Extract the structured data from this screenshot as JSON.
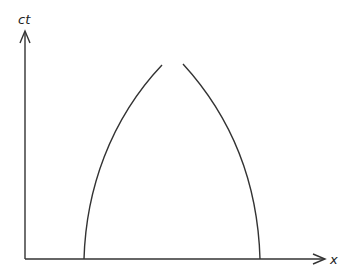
{
  "diagram": {
    "type": "spacetime-diagram",
    "axes": {
      "vertical_label": "ct",
      "horizontal_label": "x"
    },
    "curves": [
      {
        "name": "left-worldline",
        "description": "curve rising from x-axis near left, bending rightward toward top"
      },
      {
        "name": "right-worldline",
        "description": "curve rising from x-axis near right, bending leftward toward top"
      }
    ],
    "colors": {
      "stroke": "#333333",
      "background": "#ffffff"
    }
  }
}
